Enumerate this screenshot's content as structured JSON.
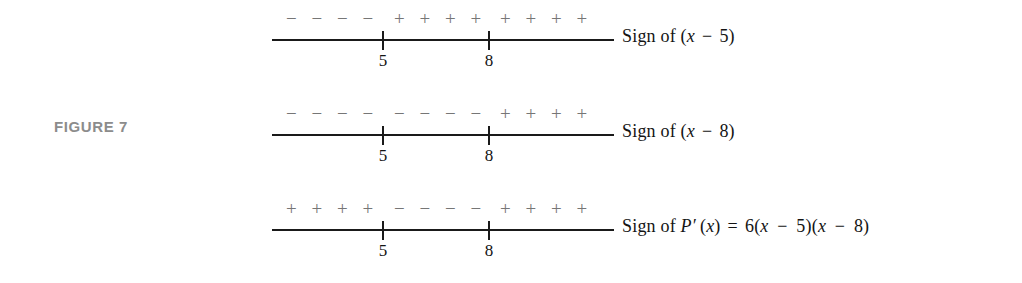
{
  "figure": {
    "caption": "FIGURE 7"
  },
  "colors": {
    "line": "#1a1a1a",
    "sign_text": "#767676",
    "caption": "#8c8c8c",
    "label_text": "#141414",
    "background": "#ffffff"
  },
  "axis": {
    "ticks": [
      {
        "label": "5"
      },
      {
        "label": "8"
      }
    ]
  },
  "rows": [
    {
      "id": "sign-of-x-minus-5",
      "segments": [
        {
          "sign": "− − − −",
          "value": "negative"
        },
        {
          "sign": "+ + + +",
          "value": "positive"
        },
        {
          "sign": "+ + + +",
          "value": "positive"
        }
      ],
      "label": {
        "prefix": "Sign of (",
        "variable": "x",
        "operator": "−",
        "constant": "5",
        "suffix": ")",
        "full": "Sign of (x − 5)"
      }
    },
    {
      "id": "sign-of-x-minus-8",
      "segments": [
        {
          "sign": "− − − −",
          "value": "negative"
        },
        {
          "sign": "− − − −",
          "value": "negative"
        },
        {
          "sign": "+ + + +",
          "value": "positive"
        }
      ],
      "label": {
        "prefix": "Sign of (",
        "variable": "x",
        "operator": "−",
        "constant": "8",
        "suffix": ")",
        "full": "Sign of (x − 8)"
      }
    },
    {
      "id": "sign-of-p-prime-x",
      "segments": [
        {
          "sign": "+ + + +",
          "value": "positive"
        },
        {
          "sign": "− − − −",
          "value": "negative"
        },
        {
          "sign": "+ + + +",
          "value": "positive"
        }
      ],
      "label": {
        "prefix": "Sign of ",
        "function": "P′",
        "arg_open": "(",
        "variable": "x",
        "arg_close": ")",
        "equals": "=",
        "coefficient": "6",
        "factor1": "(x − 5)",
        "factor2": "(x − 8)",
        "full": "Sign of P′(x) = 6(x − 5)(x − 8)"
      }
    }
  ],
  "chart_data": {
    "type": "table",
    "title": "FIGURE 7",
    "x": [
      5,
      8
    ],
    "xlabel": "x",
    "categories": [
      "x < 5",
      "5 < x < 8",
      "x > 8"
    ],
    "series": [
      {
        "name": "Sign of (x − 5)",
        "values": [
          "−",
          "+",
          "+"
        ]
      },
      {
        "name": "Sign of (x − 8)",
        "values": [
          "−",
          "−",
          "+"
        ]
      },
      {
        "name": "Sign of P′(x) = 6(x − 5)(x − 8)",
        "values": [
          "+",
          "−",
          "+"
        ]
      }
    ],
    "grid": false,
    "legend": "none"
  }
}
